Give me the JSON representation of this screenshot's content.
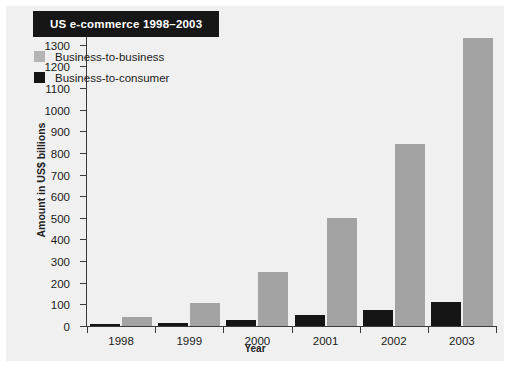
{
  "chart_data": {
    "type": "bar",
    "title": "US e-commerce 1998–2003",
    "xlabel": "Year",
    "ylabel": "Amount in US$ billions",
    "categories": [
      "1998",
      "1999",
      "2000",
      "2001",
      "2002",
      "2003"
    ],
    "series": [
      {
        "name": "Business-to-consumer",
        "color": "#151515",
        "values": [
          8,
          15,
          30,
          50,
          75,
          110
        ]
      },
      {
        "name": "Business-to-business",
        "color": "#a3a3a3",
        "values": [
          40,
          105,
          250,
          500,
          840,
          1330
        ]
      }
    ],
    "ylim": [
      0,
      1400
    ],
    "ytick_step": 100,
    "yticks": [
      0,
      100,
      200,
      300,
      400,
      500,
      600,
      700,
      800,
      900,
      1000,
      1100,
      1200,
      1300,
      1400
    ],
    "ytick_labels": [
      "0",
      "100",
      "200",
      "300",
      "400",
      "500",
      "600",
      "700",
      "800",
      "900",
      "1000",
      "1100",
      "1200",
      "1300",
      "1400"
    ],
    "grid": false,
    "legend_position": "top-left",
    "bar_group_order": [
      "Business-to-consumer",
      "Business-to-business"
    ]
  },
  "legend": {
    "items": [
      {
        "label": "Business-to-business",
        "swatch": "b2b"
      },
      {
        "label": "Business-to-consumer",
        "swatch": "b2c"
      }
    ]
  }
}
